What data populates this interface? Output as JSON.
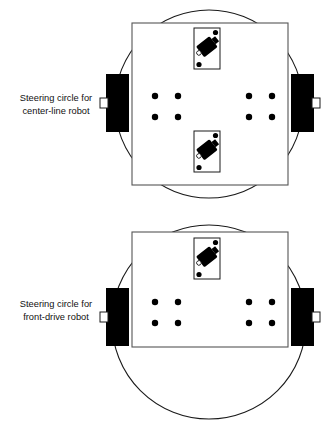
{
  "figure": {
    "title": "",
    "background_color": "#ffffff",
    "stroke_color": "#1a1a1a",
    "fill_black": "#000000",
    "panels": [
      {
        "id": "center-line-robot",
        "caption_line1": "Steering circle for",
        "caption_line2": "center-line robot",
        "caption_x": 56,
        "caption_y1": 101,
        "caption_y2": 114,
        "steering_circle": {
          "cx": 209,
          "cy": 104,
          "r": 94
        },
        "chassis": {
          "x": 132,
          "y": 23,
          "w": 156,
          "h": 162
        },
        "wheels": [
          {
            "side": "left",
            "x": 106,
            "y": 74,
            "w": 23,
            "h": 58
          },
          {
            "side": "right",
            "x": 291,
            "y": 74,
            "w": 23,
            "h": 58
          }
        ],
        "axle_stubs": [
          {
            "side": "left",
            "x": 100,
            "y": 98,
            "w": 8,
            "h": 10
          },
          {
            "side": "right",
            "x": 312,
            "y": 98,
            "w": 8,
            "h": 10
          }
        ],
        "motors": [
          {
            "position": "front",
            "x": 194,
            "y": 28,
            "w": 26,
            "h": 41,
            "angle": -38
          },
          {
            "position": "rear",
            "x": 194,
            "y": 131,
            "w": 26,
            "h": 41,
            "angle": -38
          }
        ],
        "mount_dots": [
          {
            "cx": 155,
            "cy": 96
          },
          {
            "cx": 178,
            "cy": 96
          },
          {
            "cx": 155,
            "cy": 117
          },
          {
            "cx": 178,
            "cy": 117
          },
          {
            "cx": 249,
            "cy": 96
          },
          {
            "cx": 272,
            "cy": 96
          },
          {
            "cx": 249,
            "cy": 117
          },
          {
            "cx": 272,
            "cy": 117
          }
        ],
        "dot_radius": 3.2
      },
      {
        "id": "front-drive-robot",
        "caption_line1": "Steering circle for",
        "caption_line2": "front-drive robot",
        "caption_x": 56,
        "caption_y1": 307,
        "caption_y2": 320,
        "steering_circle": {
          "cx": 209,
          "cy": 322,
          "r": 97
        },
        "chassis": {
          "x": 132,
          "y": 232,
          "w": 156,
          "h": 115
        },
        "wheels": [
          {
            "side": "left",
            "x": 106,
            "y": 288,
            "w": 23,
            "h": 58
          },
          {
            "side": "right",
            "x": 291,
            "y": 288,
            "w": 23,
            "h": 58
          }
        ],
        "axle_stubs": [
          {
            "side": "left",
            "x": 100,
            "y": 312,
            "w": 8,
            "h": 10
          },
          {
            "side": "right",
            "x": 312,
            "y": 312,
            "w": 8,
            "h": 10
          }
        ],
        "motors": [
          {
            "position": "front",
            "x": 194,
            "y": 238,
            "w": 26,
            "h": 41,
            "angle": -38
          }
        ],
        "mount_dots": [
          {
            "cx": 155,
            "cy": 302
          },
          {
            "cx": 178,
            "cy": 302
          },
          {
            "cx": 155,
            "cy": 323
          },
          {
            "cx": 178,
            "cy": 323
          },
          {
            "cx": 249,
            "cy": 302
          },
          {
            "cx": 272,
            "cy": 302
          },
          {
            "cx": 249,
            "cy": 323
          },
          {
            "cx": 272,
            "cy": 323
          }
        ],
        "dot_radius": 3.2
      }
    ]
  }
}
